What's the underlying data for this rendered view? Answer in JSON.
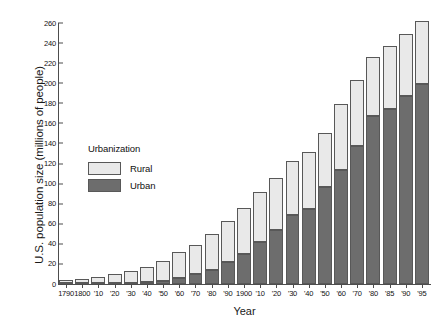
{
  "chart_data": {
    "type": "bar",
    "stacked": true,
    "title": "",
    "xlabel": "Year",
    "ylabel": "U.S. population size (millions of people)",
    "ylim": [
      0,
      260
    ],
    "yticks": [
      0,
      20,
      40,
      60,
      80,
      100,
      120,
      140,
      160,
      180,
      200,
      220,
      240,
      260
    ],
    "grid": false,
    "legend": {
      "title": "Urbanization",
      "position": "inside-left",
      "entries": [
        {
          "name": "Rural",
          "color": "#e9e9e9"
        },
        {
          "name": "Urban",
          "color": "#6d6d6d"
        }
      ]
    },
    "categories": [
      "1790",
      "1800",
      "'10",
      "'20",
      "'30",
      "'40",
      "'50",
      "'60",
      "'70",
      "'80",
      "'90",
      "1900",
      "'10",
      "'20",
      "'30",
      "'40",
      "'50",
      "'60",
      "'70",
      "'80",
      "'85",
      "'90",
      "'95"
    ],
    "series": [
      {
        "name": "Urban",
        "color": "#6d6d6d",
        "values": [
          0.2,
          0.3,
          0.5,
          0.7,
          1.1,
          1.8,
          3.5,
          6.2,
          9.9,
          14.1,
          22.1,
          30.2,
          42.0,
          54.2,
          69.0,
          74.4,
          96.5,
          113.1,
          137.1,
          167.1,
          174.0,
          187.1,
          199.0
        ]
      },
      {
        "name": "Rural",
        "color": "#e9e9e9",
        "values": [
          3.7,
          4.9,
          6.7,
          8.9,
          11.7,
          15.2,
          19.6,
          25.2,
          28.7,
          36.0,
          40.8,
          45.8,
          50.0,
          51.6,
          54.0,
          57.2,
          54.2,
          66.2,
          66.4,
          59.5,
          63.0,
          61.6,
          63.5
        ]
      }
    ],
    "totals": [
      3.9,
      5.2,
      7.2,
      9.6,
      12.8,
      17.0,
      23.1,
      31.4,
      38.6,
      50.1,
      62.9,
      76.0,
      92.0,
      105.8,
      123.0,
      131.6,
      150.7,
      179.3,
      203.5,
      226.6,
      237.0,
      248.7,
      262.5
    ]
  },
  "axes": {
    "ylabel": "U.S. population size (millions of people)",
    "xlabel": "Year"
  },
  "legend": {
    "title": "Urbanization",
    "rural_label": "Rural",
    "urban_label": "Urban"
  }
}
